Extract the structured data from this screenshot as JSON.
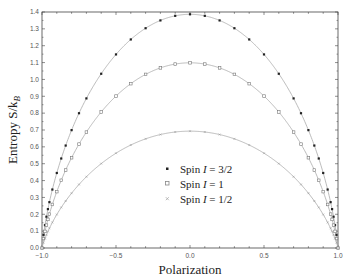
{
  "chart_data": {
    "type": "line",
    "title": "",
    "xlabel": "Polarization",
    "ylabel": "Entropy  S/k_B",
    "xlim": [
      -1.0,
      1.0
    ],
    "ylim": [
      0.0,
      1.4
    ],
    "grid": false,
    "legend_position": "lower center (inside)",
    "x_ticks": [
      "-1.0",
      "-0.5",
      "0.0",
      "0.5",
      "1.0"
    ],
    "y_ticks": [
      "0.0",
      "0.1",
      "0.2",
      "0.3",
      "0.4",
      "0.5",
      "0.6",
      "0.7",
      "0.8",
      "0.9",
      "1.0",
      "1.1",
      "1.2",
      "1.3",
      "1.4"
    ],
    "series": [
      {
        "name": "Spin I = 3/2",
        "spin": 1.5,
        "marker": "filled-square",
        "color": "#222222",
        "peak": {
          "x": 0.0,
          "y": 1.386
        }
      },
      {
        "name": "Spin I = 1",
        "spin": 1.0,
        "marker": "open-square",
        "color": "#777777",
        "peak": {
          "x": 0.0,
          "y": 1.099
        }
      },
      {
        "name": "Spin I = 1/2",
        "spin": 0.5,
        "marker": "small-cross",
        "color": "#999999",
        "peak": {
          "x": 0.0,
          "y": 0.693
        }
      }
    ],
    "marker_x": [
      -1.0,
      -0.99,
      -0.98,
      -0.97,
      -0.96,
      -0.95,
      -0.93,
      -0.9,
      -0.87,
      -0.84,
      -0.8,
      -0.75,
      -0.7,
      -0.6,
      -0.5,
      -0.4,
      -0.3,
      -0.2,
      -0.1,
      0.0,
      0.1,
      0.2,
      0.3,
      0.4,
      0.5,
      0.6,
      0.7,
      0.75,
      0.8,
      0.84,
      0.87,
      0.9,
      0.93,
      0.95,
      0.96,
      0.97,
      0.98,
      0.99,
      1.0
    ]
  },
  "legend": {
    "items": [
      {
        "label_prefix": "Spin ",
        "label_var": "I",
        "label_suffix": " = 3/2"
      },
      {
        "label_prefix": "Spin ",
        "label_var": "I",
        "label_suffix": " = 1"
      },
      {
        "label_prefix": "Spin ",
        "label_var": "I",
        "label_suffix": " = 1/2"
      }
    ]
  },
  "axes": {
    "xlabel": "Polarization",
    "ylabel_main": "Entropy  S/k",
    "ylabel_sub": "B"
  }
}
